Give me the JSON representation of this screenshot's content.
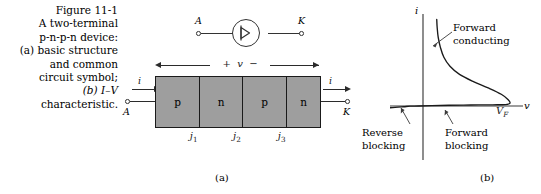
{
  "figure": {
    "caption_lines": [
      "Figure 11-1",
      "A two-terminal",
      "p-n-p-n device:",
      "(a) basic structure",
      "and common",
      "circuit symbol;",
      "(b) I–V",
      "characteristic."
    ],
    "sublabel_a": "(a)",
    "sublabel_b": "(b)"
  },
  "symbol": {
    "anode_label": "A",
    "cathode_label": "K",
    "glyph_name": "thyristor-diode-symbol"
  },
  "structure": {
    "voltage_annotation": "+  v  −",
    "current_label_left": "i",
    "current_label_right": "i",
    "anode_label": "A",
    "cathode_label": "K",
    "layers": [
      {
        "type": "p",
        "label": "p",
        "width_pct": 27
      },
      {
        "type": "n",
        "label": "n",
        "width_pct": 26
      },
      {
        "type": "p",
        "label": "p",
        "width_pct": 27
      },
      {
        "type": "n",
        "label": "n",
        "width_pct": 20
      }
    ],
    "fill_color": "#9e9e9e",
    "junctions": [
      {
        "label": "j",
        "sub": "1",
        "x_pct": 27
      },
      {
        "label": "j",
        "sub": "2",
        "x_pct": 53
      },
      {
        "label": "j",
        "sub": "3",
        "x_pct": 80
      }
    ]
  },
  "chart_data": {
    "type": "line",
    "title": "",
    "xlabel": "v",
    "ylabel": "i",
    "grid": false,
    "legend": null,
    "annotations": [
      {
        "name": "forward-conducting",
        "text": "Forward\nconducting"
      },
      {
        "name": "reverse-blocking",
        "text": "Reverse\nblocking"
      },
      {
        "name": "forward-blocking",
        "text": "Forward\nblocking"
      }
    ],
    "tick_labels": [
      {
        "axis": "x",
        "label": "V",
        "sub": "F",
        "value": "V_F"
      }
    ],
    "series": [
      {
        "name": "pnpn-i-v-characteristic",
        "description": "Thyristor S-shaped characteristic: reverse blocking (small negative current), forward blocking (near-zero current up to breakover V_F), negative resistance turn-back, then forward conducting (steep rise at low voltage).",
        "points": [
          [
            -1.0,
            -0.035
          ],
          [
            -0.8,
            -0.03
          ],
          [
            -0.6,
            -0.026
          ],
          [
            -0.45,
            -0.022
          ],
          [
            -0.32,
            -0.016
          ],
          [
            -0.22,
            -0.008
          ],
          [
            -0.15,
            -0.002
          ],
          [
            -0.05,
            0.0
          ],
          [
            0.1,
            0.004
          ],
          [
            0.3,
            0.008
          ],
          [
            0.55,
            0.011
          ],
          [
            0.8,
            0.013
          ],
          [
            0.95,
            0.016
          ],
          [
            1.0,
            0.03
          ],
          [
            0.98,
            0.07
          ],
          [
            0.9,
            0.13
          ],
          [
            0.75,
            0.2
          ],
          [
            0.58,
            0.27
          ],
          [
            0.42,
            0.35
          ],
          [
            0.31,
            0.44
          ],
          [
            0.24,
            0.54
          ],
          [
            0.2,
            0.65
          ],
          [
            0.175,
            0.76
          ],
          [
            0.163,
            0.87
          ],
          [
            0.158,
            0.96
          ]
        ]
      }
    ],
    "xlim": [
      -1.05,
      1.15
    ],
    "ylim": [
      -0.12,
      1.02
    ]
  }
}
